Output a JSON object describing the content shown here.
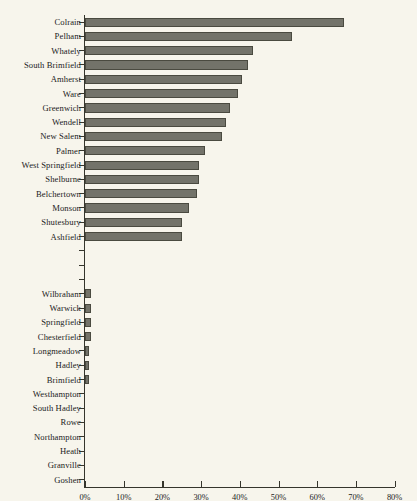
{
  "chart_data": {
    "type": "bar",
    "orientation": "horizontal",
    "title": "",
    "subtitle": "",
    "xlabel": "",
    "ylabel": "",
    "xlim": [
      0,
      80
    ],
    "xtick_labels": [
      "0%",
      "10%",
      "20%",
      "30%",
      "40%",
      "50%",
      "60%",
      "70%",
      "80%"
    ],
    "xtick_values": [
      0,
      10,
      20,
      30,
      40,
      50,
      60,
      70,
      80
    ],
    "grid": false,
    "legend": false,
    "bar_color": "#73736a",
    "bar_border_color": "#4a4a40",
    "axis_color": "#35352c",
    "background_color": "#f7f5ec",
    "categories": [
      "Colrain",
      "Pelham",
      "Whately",
      "South Brimfield",
      "Amherst",
      "Ware",
      "Greenwich",
      "Wendell",
      "New Salem",
      "Palmer",
      "West Springfield",
      "Shelburne",
      "Belchertown",
      "Monson",
      "Shutesbury",
      "Ashfield",
      "",
      "",
      "",
      "Wilbraham",
      "Warwick",
      "Springfield",
      "Chesterfield",
      "Longmeadow",
      "Hadley",
      "Brimfield",
      "Westhampton",
      "South Hadley",
      "Rowe",
      "Northampton",
      "Heath",
      "Granville",
      "Goshen"
    ],
    "values": [
      67.0,
      53.5,
      43.5,
      42.0,
      40.5,
      39.5,
      37.5,
      36.5,
      35.5,
      31.0,
      29.5,
      29.5,
      29.0,
      27.0,
      25.0,
      25.0,
      0,
      0,
      0,
      1.6,
      1.6,
      1.6,
      1.6,
      1.0,
      1.0,
      1.0,
      0,
      0,
      0,
      0,
      0,
      0,
      0
    ]
  }
}
